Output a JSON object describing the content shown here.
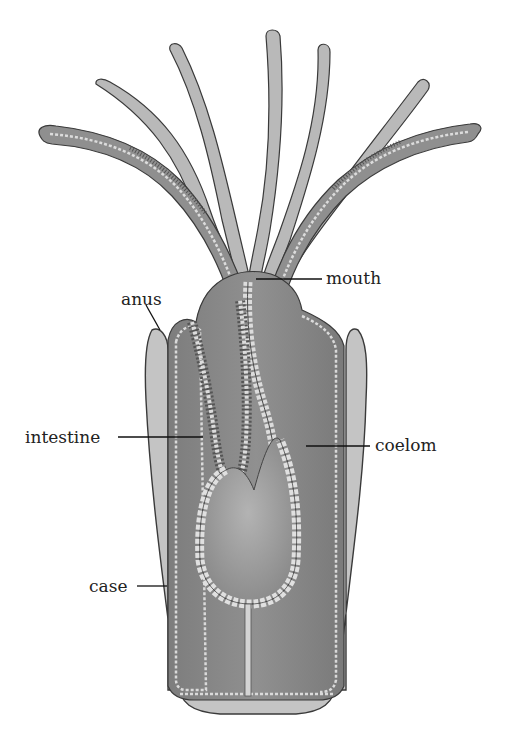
{
  "diagram": {
    "labels": [
      {
        "id": "mouth",
        "text": "mouth",
        "x": 326,
        "y": 270
      },
      {
        "id": "anus",
        "text": "anus",
        "x": 121,
        "y": 296
      },
      {
        "id": "intestine",
        "text": "intestine",
        "x": 25,
        "y": 429
      },
      {
        "id": "coelom",
        "text": "coelom",
        "x": 375,
        "y": 437
      },
      {
        "id": "case",
        "text": "case",
        "x": 89,
        "y": 578
      }
    ],
    "colors": {
      "background": "#ffffff",
      "tentacle_fill": "#b9b9b9",
      "tissue_fill": "#8a8a8a",
      "case_fill": "#c4c4c4",
      "cell_layer": "#d8d8d8",
      "outline": "#3a3a3a",
      "leader_line": "#111111",
      "label_text": "#222222"
    }
  }
}
